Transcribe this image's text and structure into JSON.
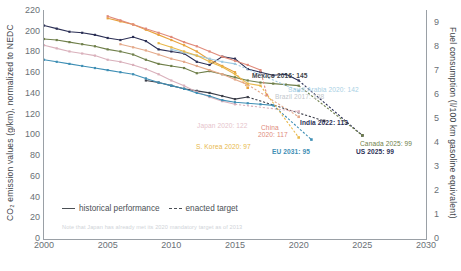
{
  "chart_data": {
    "type": "line",
    "title": "",
    "xlabel": "",
    "ylabel": "CO₂ emission values (g/km), normalized to NEDC",
    "ylabel_right": "Fuel consumption (l/100 km gasoline equivalent)",
    "xlim": [
      2000,
      2030
    ],
    "ylim": [
      0,
      220
    ],
    "ylim_right": [
      0,
      9.5
    ],
    "grid": false,
    "legend_position": "bottom-left",
    "xticks": [
      2000,
      2005,
      2010,
      2015,
      2020,
      2025,
      2030
    ],
    "yticks": [
      0,
      20,
      40,
      60,
      80,
      100,
      120,
      140,
      160,
      180,
      200,
      220
    ],
    "yticks_right": [
      0,
      1,
      2,
      3,
      4,
      5,
      6,
      7,
      8,
      9
    ],
    "legend": [
      {
        "label": "historical performance",
        "style": "solid"
      },
      {
        "label": "enacted target",
        "style": "dashed"
      }
    ],
    "footnote": "Note that Japan has already met its 2020 mandatory target as of 2013",
    "series": [
      {
        "name": "US",
        "color": "#2b2f55",
        "label": "US 2025: 99",
        "label_color": "#2b2f55",
        "label_bold": true,
        "historical": [
          [
            2000,
            205
          ],
          [
            2001,
            202
          ],
          [
            2002,
            199
          ],
          [
            2003,
            198
          ],
          [
            2004,
            196
          ],
          [
            2005,
            193
          ],
          [
            2006,
            191
          ],
          [
            2007,
            194
          ],
          [
            2008,
            190
          ],
          [
            2009,
            182
          ],
          [
            2010,
            180
          ],
          [
            2011,
            178
          ],
          [
            2012,
            170
          ],
          [
            2013,
            167
          ],
          [
            2014,
            175
          ],
          [
            2015,
            173
          ],
          [
            2016,
            163
          ],
          [
            2017,
            160
          ],
          [
            2018,
            157
          ],
          [
            2019,
            158
          ],
          [
            2020,
            152
          ]
        ],
        "target": [
          [
            2020,
            152
          ],
          [
            2025,
            99
          ]
        ]
      },
      {
        "name": "Canada",
        "color": "#6f7f4a",
        "label": "Canada 2025: 99",
        "label_color": "#6f7f4a",
        "label_bold": false,
        "historical": [
          [
            2000,
            192
          ],
          [
            2001,
            191
          ],
          [
            2002,
            189
          ],
          [
            2003,
            187
          ],
          [
            2004,
            185
          ],
          [
            2005,
            182
          ],
          [
            2006,
            180
          ],
          [
            2007,
            177
          ],
          [
            2008,
            172
          ],
          [
            2009,
            168
          ],
          [
            2010,
            166
          ],
          [
            2011,
            164
          ],
          [
            2012,
            159
          ],
          [
            2013,
            161
          ],
          [
            2014,
            158
          ],
          [
            2015,
            155
          ],
          [
            2016,
            152
          ],
          [
            2017,
            150
          ],
          [
            2018,
            149
          ],
          [
            2019,
            148
          ],
          [
            2020,
            147
          ]
        ],
        "target": [
          [
            2020,
            147
          ],
          [
            2025,
            99
          ]
        ]
      },
      {
        "name": "Mexico",
        "color": "#e8a33d",
        "label": "Mexico 2016: 145",
        "label_color": "#3f454b",
        "label_bold": false,
        "historical": [
          [
            2005,
            212
          ],
          [
            2006,
            209
          ],
          [
            2007,
            206
          ],
          [
            2008,
            201
          ],
          [
            2009,
            196
          ],
          [
            2010,
            191
          ],
          [
            2011,
            186
          ],
          [
            2012,
            180
          ],
          [
            2013,
            172
          ],
          [
            2014,
            166
          ],
          [
            2015,
            160
          ]
        ],
        "target": [
          [
            2015,
            160
          ],
          [
            2016,
            145
          ]
        ]
      },
      {
        "name": "Brazil",
        "color": "#e08a7a",
        "label": "Brazil 2017: 138",
        "label_color": "#b9bfc5",
        "label_bold": false,
        "historical": [
          [
            2005,
            214
          ],
          [
            2006,
            210
          ],
          [
            2007,
            206
          ],
          [
            2008,
            202
          ],
          [
            2009,
            198
          ],
          [
            2010,
            194
          ],
          [
            2011,
            189
          ],
          [
            2012,
            185
          ],
          [
            2013,
            180
          ],
          [
            2014,
            175
          ],
          [
            2015,
            171
          ],
          [
            2016,
            167
          ],
          [
            2017,
            162
          ]
        ],
        "target": [
          [
            2017,
            162
          ],
          [
            2017.5,
            138
          ]
        ]
      },
      {
        "name": "Saudi Arabia",
        "color": "#9ec9e2",
        "label": "Saudi Arabia 2020: 142",
        "label_color": "#9ec9e2",
        "label_bold": false,
        "historical": [
          [
            2010,
            182
          ],
          [
            2011,
            179
          ],
          [
            2012,
            176
          ],
          [
            2013,
            173
          ],
          [
            2014,
            170
          ],
          [
            2015,
            168
          ]
        ],
        "target": [
          [
            2015,
            168
          ],
          [
            2020,
            142
          ]
        ]
      },
      {
        "name": "India",
        "color": "#3c3f4a",
        "label": "India 2022: 113",
        "label_color": "#2b2f55",
        "label_bold": false,
        "historical": [
          [
            2008,
            152
          ],
          [
            2009,
            150
          ],
          [
            2010,
            147
          ],
          [
            2011,
            144
          ],
          [
            2012,
            142
          ],
          [
            2013,
            140
          ],
          [
            2014,
            137
          ],
          [
            2015,
            134
          ],
          [
            2016,
            136
          ]
        ],
        "target": [
          [
            2016,
            136
          ],
          [
            2022,
            113
          ]
        ]
      },
      {
        "name": "China",
        "color": "#e4a98a",
        "label": "China\n2020: 117",
        "label_line1": "China",
        "label_line2": "2020: 117",
        "label_color": "#e08a7a",
        "label_bold": false,
        "historical": [
          [
            2006,
            187
          ],
          [
            2007,
            184
          ],
          [
            2008,
            181
          ],
          [
            2009,
            177
          ],
          [
            2010,
            173
          ],
          [
            2011,
            170
          ],
          [
            2012,
            166
          ],
          [
            2013,
            162
          ],
          [
            2014,
            158
          ],
          [
            2015,
            153
          ],
          [
            2016,
            148
          ]
        ],
        "target": [
          [
            2016,
            148
          ],
          [
            2020,
            117
          ]
        ]
      },
      {
        "name": "Japan",
        "color": "#d9b0bb",
        "label": "Japan 2020: 122",
        "label_color": "#e1c0c8",
        "label_bold": false,
        "historical": [
          [
            2000,
            186
          ],
          [
            2001,
            183
          ],
          [
            2002,
            180
          ],
          [
            2003,
            178
          ],
          [
            2004,
            176
          ],
          [
            2005,
            172
          ],
          [
            2006,
            170
          ],
          [
            2007,
            167
          ],
          [
            2008,
            163
          ],
          [
            2009,
            158
          ],
          [
            2010,
            152
          ],
          [
            2011,
            147
          ],
          [
            2012,
            141
          ],
          [
            2013,
            136
          ],
          [
            2014,
            132
          ],
          [
            2015,
            129
          ]
        ],
        "target": [
          [
            2015,
            129
          ],
          [
            2020,
            122
          ]
        ]
      },
      {
        "name": "EU",
        "color": "#3f8fb5",
        "label": "EU 2021: 95",
        "label_color": "#3f8fb5",
        "label_bold": false,
        "historical": [
          [
            2000,
            172
          ],
          [
            2001,
            170
          ],
          [
            2002,
            168
          ],
          [
            2003,
            166
          ],
          [
            2004,
            164
          ],
          [
            2005,
            162
          ],
          [
            2006,
            160
          ],
          [
            2007,
            158
          ],
          [
            2008,
            154
          ],
          [
            2009,
            150
          ],
          [
            2010,
            147
          ],
          [
            2011,
            144
          ],
          [
            2012,
            140
          ],
          [
            2013,
            137
          ],
          [
            2014,
            133
          ],
          [
            2015,
            131
          ],
          [
            2016,
            130
          ],
          [
            2017,
            129
          ],
          [
            2018,
            128
          ]
        ],
        "target": [
          [
            2018,
            128
          ],
          [
            2021,
            95
          ]
        ]
      },
      {
        "name": "S. Korea",
        "color": "#e8b84b",
        "label": "S. Korea 2020: 97",
        "label_color": "#e8b84b",
        "label_bold": false,
        "historical": [
          [
            2009,
            188
          ],
          [
            2010,
            184
          ],
          [
            2011,
            180
          ],
          [
            2012,
            176
          ],
          [
            2013,
            170
          ],
          [
            2014,
            165
          ],
          [
            2015,
            158
          ],
          [
            2016,
            149
          ],
          [
            2017,
            147
          ]
        ],
        "target": [
          [
            2017,
            147
          ],
          [
            2020,
            97
          ]
        ]
      }
    ],
    "annotations": [
      {
        "text": "Mexico 2016: 145",
        "x": 252,
        "y": 72,
        "color": "#3f454b",
        "bold": true
      },
      {
        "text": "Saudi Arabia 2020: 142",
        "x": 288,
        "y": 86,
        "color": "#a8cfe4",
        "bold": false
      },
      {
        "text": "Brazil 2017: 138",
        "x": 275,
        "y": 93,
        "color": "#c2c7cc",
        "bold": false
      },
      {
        "text": "Japan 2020: 122",
        "x": 197,
        "y": 122,
        "color": "#e6c3cb",
        "bold": false
      },
      {
        "text": "China",
        "x": 261,
        "y": 124,
        "color": "#e08a7a",
        "bold": false
      },
      {
        "text": "2020: 117",
        "x": 258,
        "y": 131,
        "color": "#e08a7a",
        "bold": false
      },
      {
        "text": "India 2022: 113",
        "x": 300,
        "y": 119,
        "color": "#2b2f55",
        "bold": true
      },
      {
        "text": "S. Korea 2020: 97",
        "x": 196,
        "y": 143,
        "color": "#e8b84b",
        "bold": false
      },
      {
        "text": "EU 2031: 95",
        "x": 272,
        "y": 148,
        "color": "#3f8fb5",
        "bold": true
      },
      {
        "text": "Canada 2025: 99",
        "x": 360,
        "y": 140,
        "color": "#6f7f4a",
        "bold": false
      },
      {
        "text": "US 2025: 99",
        "x": 356,
        "y": 148,
        "color": "#2b2f55",
        "bold": true
      }
    ]
  }
}
